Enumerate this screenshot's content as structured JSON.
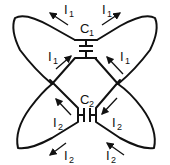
{
  "diagram": {
    "type": "circuit-loop-diagram",
    "capacitors": [
      {
        "id": "C1",
        "label": "C",
        "subscript": "1",
        "orientation": "horizontal-plates"
      },
      {
        "id": "C2",
        "label": "C",
        "subscript": "2",
        "orientation": "vertical-plates"
      }
    ],
    "currents": [
      {
        "label": "I",
        "subscript": "1",
        "position": "top-left",
        "direction": "up-left"
      },
      {
        "label": "I",
        "subscript": "1",
        "position": "top-right",
        "direction": "up-right"
      },
      {
        "label": "I",
        "subscript": "1",
        "position": "mid-left",
        "direction": "up-right"
      },
      {
        "label": "I",
        "subscript": "1",
        "position": "mid-right",
        "direction": "up-left"
      },
      {
        "label": "I",
        "subscript": "2",
        "position": "lower-left-inner",
        "direction": "up-left"
      },
      {
        "label": "I",
        "subscript": "2",
        "position": "lower-right-inner",
        "direction": "down-left"
      },
      {
        "label": "I",
        "subscript": "2",
        "position": "bottom-left",
        "direction": "down-left"
      },
      {
        "label": "I",
        "subscript": "2",
        "position": "bottom-right",
        "direction": "up-left"
      }
    ],
    "colors": {
      "stroke": "#111111",
      "background": "#ffffff"
    }
  }
}
